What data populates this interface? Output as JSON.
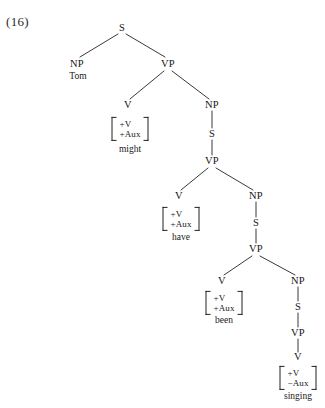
{
  "figure": {
    "example_number": "(16)",
    "caption_sentence": "Tom might have been singing",
    "line_color": "#222222",
    "text_color": "#161616",
    "background": "#ffffff"
  },
  "nodes": [
    {
      "id": "s1",
      "label": "S",
      "x": 122,
      "y": 28
    },
    {
      "id": "np1",
      "label": "NP",
      "x": 77,
      "y": 64
    },
    {
      "id": "vp1",
      "label": "VP",
      "x": 168,
      "y": 64
    },
    {
      "id": "v1",
      "label": "V",
      "x": 128,
      "y": 105
    },
    {
      "id": "np2",
      "label": "NP",
      "x": 212,
      "y": 105
    },
    {
      "id": "s2",
      "label": "S",
      "x": 212,
      "y": 134
    },
    {
      "id": "vp2",
      "label": "VP",
      "x": 212,
      "y": 161
    },
    {
      "id": "v2",
      "label": "V",
      "x": 179,
      "y": 196
    },
    {
      "id": "np3",
      "label": "NP",
      "x": 256,
      "y": 196
    },
    {
      "id": "s3",
      "label": "S",
      "x": 256,
      "y": 223
    },
    {
      "id": "vp3",
      "label": "VP",
      "x": 256,
      "y": 249
    },
    {
      "id": "v3",
      "label": "V",
      "x": 222,
      "y": 281
    },
    {
      "id": "np4",
      "label": "NP",
      "x": 298,
      "y": 281
    },
    {
      "id": "s4",
      "label": "S",
      "x": 298,
      "y": 307
    },
    {
      "id": "vp4",
      "label": "VP",
      "x": 298,
      "y": 333
    },
    {
      "id": "v4",
      "label": "V",
      "x": 298,
      "y": 357
    }
  ],
  "edges": [
    {
      "from": "s1",
      "to": "np1",
      "x1": 118,
      "y1": 34,
      "x2": 80,
      "y2": 57
    },
    {
      "from": "s1",
      "to": "vp1",
      "x1": 126,
      "y1": 34,
      "x2": 165,
      "y2": 57
    },
    {
      "from": "vp1",
      "to": "v1",
      "x1": 164,
      "y1": 71,
      "x2": 130,
      "y2": 99
    },
    {
      "from": "vp1",
      "to": "np2",
      "x1": 172,
      "y1": 71,
      "x2": 209,
      "y2": 99
    },
    {
      "from": "np2",
      "to": "s2",
      "x1": 212,
      "y1": 111,
      "x2": 212,
      "y2": 128
    },
    {
      "from": "s2",
      "to": "vp2",
      "x1": 212,
      "y1": 140,
      "x2": 212,
      "y2": 155
    },
    {
      "from": "vp2",
      "to": "v2",
      "x1": 208,
      "y1": 168,
      "x2": 181,
      "y2": 190
    },
    {
      "from": "vp2",
      "to": "np3",
      "x1": 216,
      "y1": 168,
      "x2": 253,
      "y2": 190
    },
    {
      "from": "np3",
      "to": "s3",
      "x1": 256,
      "y1": 202,
      "x2": 256,
      "y2": 217
    },
    {
      "from": "s3",
      "to": "vp3",
      "x1": 256,
      "y1": 229,
      "x2": 256,
      "y2": 243
    },
    {
      "from": "vp3",
      "to": "v3",
      "x1": 252,
      "y1": 256,
      "x2": 224,
      "y2": 275
    },
    {
      "from": "vp3",
      "to": "np4",
      "x1": 260,
      "y1": 256,
      "x2": 295,
      "y2": 275
    },
    {
      "from": "np4",
      "to": "s4",
      "x1": 298,
      "y1": 287,
      "x2": 298,
      "y2": 301
    },
    {
      "from": "s4",
      "to": "vp4",
      "x1": 298,
      "y1": 313,
      "x2": 298,
      "y2": 327
    },
    {
      "from": "vp4",
      "to": "v4",
      "x1": 298,
      "y1": 339,
      "x2": 298,
      "y2": 352
    }
  ],
  "feature_matrices": [
    {
      "id": "fm-might",
      "features": [
        "+V",
        "+Aux"
      ],
      "word": "might",
      "x": 130,
      "y": 129,
      "word_x": 130,
      "word_y": 150
    },
    {
      "id": "fm-have",
      "features": [
        "+V",
        "+Aux"
      ],
      "word": "have",
      "x": 181,
      "y": 219,
      "word_x": 181,
      "word_y": 238
    },
    {
      "id": "fm-been",
      "features": [
        "+V",
        "+Aux"
      ],
      "word": "been",
      "x": 224,
      "y": 303,
      "word_x": 224,
      "word_y": 321
    },
    {
      "id": "fm-singing",
      "features": [
        "+V",
        "−Aux"
      ],
      "word": "singing",
      "x": 298,
      "y": 378,
      "word_x": 298,
      "word_y": 397
    }
  ],
  "terminal_words": [
    {
      "id": "tom",
      "word": "Tom",
      "x": 78,
      "y": 77
    }
  ]
}
